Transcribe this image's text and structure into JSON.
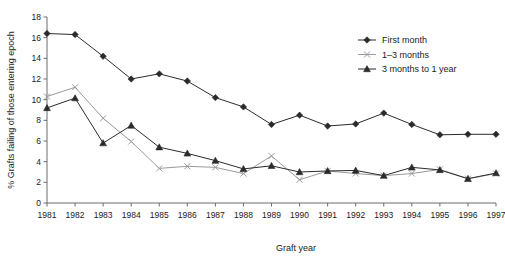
{
  "chart_data": {
    "type": "line",
    "title": "",
    "xlabel": "Graft year",
    "ylabel": "% Grafts failing of those entering epoch",
    "categories": [
      1981,
      1982,
      1983,
      1984,
      1985,
      1986,
      1987,
      1988,
      1989,
      1990,
      1991,
      1992,
      1993,
      1994,
      1995,
      1996,
      1997
    ],
    "x_tick_labels": [
      "1981",
      "1982",
      "1983",
      "1984",
      "1985",
      "1986",
      "1987",
      "1988",
      "1989",
      "1990",
      "1991",
      "1992",
      "1993",
      "1994",
      "1995",
      "1996",
      "1997"
    ],
    "y_tick_labels": [
      "0",
      "2",
      "4",
      "6",
      "8",
      "10",
      "12",
      "14",
      "16",
      "18"
    ],
    "y_ticks": [
      0,
      2,
      4,
      6,
      8,
      10,
      12,
      14,
      16,
      18
    ],
    "ylim": [
      0,
      18
    ],
    "xlim": [
      1981,
      1997
    ],
    "grid": false,
    "legend_position": "top-right",
    "series": [
      {
        "name": "First month",
        "marker": "diamond",
        "color": "#2b2b2b",
        "values": [
          16.4,
          16.3,
          14.2,
          12.0,
          12.5,
          11.8,
          10.2,
          9.3,
          7.6,
          8.5,
          7.45,
          7.65,
          8.7,
          7.6,
          6.6,
          6.65,
          6.65
        ]
      },
      {
        "name": "1–3 months",
        "marker": "x",
        "color": "#9a9a9a",
        "values": [
          10.3,
          11.2,
          8.2,
          5.95,
          3.35,
          3.55,
          3.45,
          2.85,
          4.55,
          2.25,
          3.1,
          2.85,
          2.65,
          2.85,
          3.25,
          2.35,
          2.85
        ]
      },
      {
        "name": "3 months to 1 year",
        "marker": "triangle",
        "color": "#2b2b2b",
        "values": [
          9.2,
          10.15,
          5.8,
          7.5,
          5.4,
          4.8,
          4.1,
          3.3,
          3.6,
          3.0,
          3.1,
          3.15,
          2.65,
          3.45,
          3.2,
          2.35,
          2.9
        ]
      }
    ]
  },
  "legend": {
    "items": [
      {
        "label": "First month"
      },
      {
        "label": "1–3 months"
      },
      {
        "label": "3 months to 1 year"
      }
    ]
  }
}
